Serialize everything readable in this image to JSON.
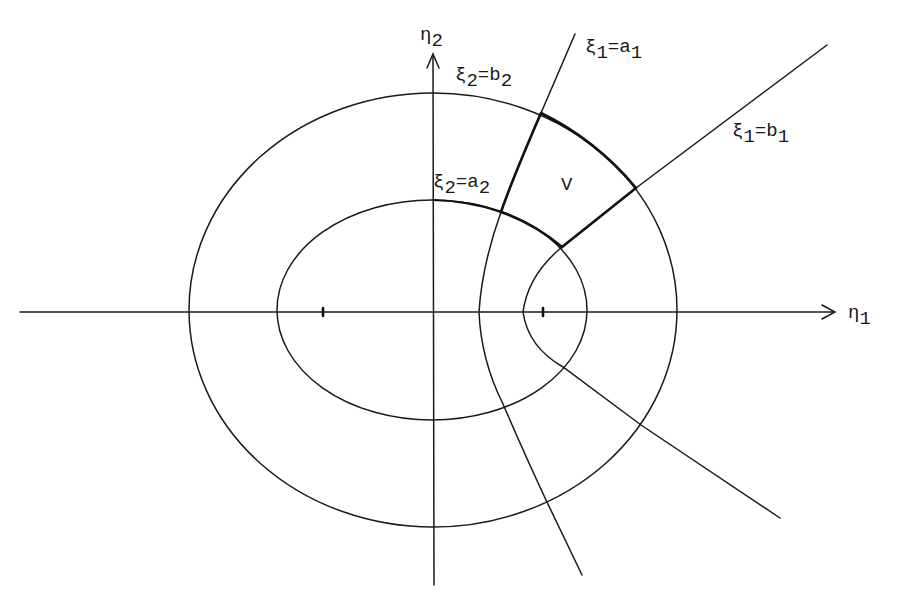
{
  "figure": {
    "colors": {
      "ink": "#1a1a1a",
      "background": "#ffffff"
    },
    "axes": {
      "horizontal": {
        "symbol": "η",
        "subscript": "1"
      },
      "vertical": {
        "symbol": "η",
        "subscript": "2"
      }
    },
    "foci_marks": [
      "left-focus",
      "right-focus"
    ],
    "curves": [
      {
        "id": "outer-ellipse",
        "label_symbol": "ξ",
        "label_sub": "2",
        "label_eq": "=b",
        "label_val_sub": "2"
      },
      {
        "id": "inner-ellipse",
        "label_symbol": "ξ",
        "label_sub": "2",
        "label_eq": "=a",
        "label_val_sub": "2"
      },
      {
        "id": "hyperbola-a1",
        "label_symbol": "ξ",
        "label_sub": "1",
        "label_eq": "=a",
        "label_val_sub": "1"
      },
      {
        "id": "hyperbola-b1",
        "label_symbol": "ξ",
        "label_sub": "1",
        "label_eq": "=b",
        "label_val_sub": "1"
      }
    ],
    "region_label": "V"
  }
}
